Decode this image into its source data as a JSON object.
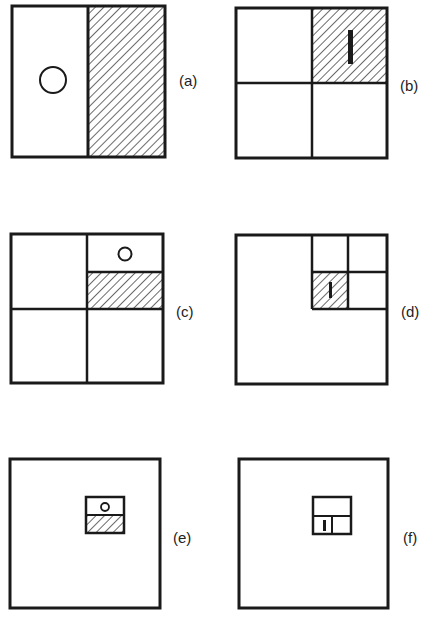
{
  "colors": {
    "stroke": "#1a1a1a",
    "hatch": "#2a2a2a",
    "background": "#ffffff"
  },
  "panels": [
    {
      "id": "a",
      "label": "(a)",
      "description": "Square split vertically; left half contains a circle, right half hatched"
    },
    {
      "id": "b",
      "label": "(b)",
      "description": "Square split into quadrants; top-right quadrant hatched with a vertical bar"
    },
    {
      "id": "c",
      "label": "(c)",
      "description": "Quadrants; top-right split horizontally with circle above and hatched strip below"
    },
    {
      "id": "d",
      "label": "(d)",
      "description": "Large square with top-right quadrant subdivided 2x2; lower-left subcell hatched with small bar"
    },
    {
      "id": "e",
      "label": "(e)",
      "description": "Large square with small inner box: circle top, hatched bottom"
    },
    {
      "id": "f",
      "label": "(f)",
      "description": "Large square with small inner box: top empty, bottom split with small bar"
    }
  ]
}
